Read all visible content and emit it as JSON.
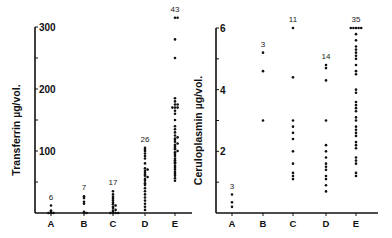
{
  "chart_data": [
    {
      "type": "scatter",
      "title": "",
      "ylabel": "Transferrin  µg/vol.",
      "xlabel": "",
      "ylim": [
        0,
        300
      ],
      "yticks": [
        100,
        200,
        300
      ],
      "ytick_labels": [
        "100",
        "200",
        "300"
      ],
      "categories": [
        "A",
        "B",
        "C",
        "D",
        "E"
      ],
      "counts": [
        "6",
        "7",
        "17",
        "26",
        "43"
      ],
      "series": [
        {
          "name": "A",
          "values": [
            0,
            0,
            0,
            2,
            4,
            12
          ]
        },
        {
          "name": "B",
          "values": [
            0,
            0,
            2,
            15,
            18,
            24,
            27
          ]
        },
        {
          "name": "C",
          "values": [
            0,
            0,
            0,
            0,
            2,
            4,
            5,
            8,
            10,
            12,
            14,
            17,
            20,
            23,
            26,
            30,
            35
          ]
        },
        {
          "name": "D",
          "values": [
            5,
            10,
            15,
            20,
            25,
            30,
            35,
            40,
            45,
            48,
            52,
            55,
            58,
            60,
            62,
            65,
            68,
            70,
            72,
            80,
            88,
            92,
            96,
            100,
            102,
            105
          ]
        },
        {
          "name": "E",
          "values": [
            52,
            56,
            60,
            63,
            66,
            70,
            73,
            76,
            80,
            82,
            85,
            88,
            92,
            95,
            98,
            100,
            103,
            105,
            108,
            110,
            112,
            115,
            118,
            120,
            122,
            125,
            130,
            135,
            140,
            150,
            160,
            165,
            170,
            170,
            170,
            175,
            175,
            180,
            185,
            250,
            280,
            315,
            315
          ]
        }
      ]
    },
    {
      "type": "scatter",
      "title": "",
      "ylabel": "Ceruloplasmin  µg/vol.",
      "xlabel": "",
      "ylim": [
        0,
        6
      ],
      "yticks": [
        2,
        4,
        6
      ],
      "ytick_labels": [
        "2",
        "4",
        "6"
      ],
      "categories": [
        "A",
        "B",
        "C",
        "D",
        "E"
      ],
      "counts": [
        "3",
        "3",
        "11",
        "14",
        "35"
      ],
      "series": [
        {
          "name": "A",
          "values": [
            0.2,
            0.35,
            0.6
          ]
        },
        {
          "name": "B",
          "values": [
            3.0,
            4.6,
            5.2
          ]
        },
        {
          "name": "C",
          "values": [
            1.1,
            1.2,
            1.3,
            1.6,
            2.0,
            2.4,
            2.6,
            2.8,
            3.0,
            4.4,
            6.0
          ]
        },
        {
          "name": "D",
          "values": [
            0.7,
            0.9,
            1.1,
            1.2,
            1.4,
            1.5,
            1.6,
            1.8,
            2.0,
            2.2,
            3.0,
            4.3,
            4.7,
            4.8
          ]
        },
        {
          "name": "E",
          "values": [
            1.2,
            1.3,
            1.6,
            1.7,
            1.8,
            2.1,
            2.2,
            2.3,
            2.5,
            2.6,
            2.7,
            2.8,
            3.0,
            3.1,
            3.3,
            3.4,
            3.5,
            3.6,
            3.9,
            4.0,
            4.5,
            4.6,
            4.8,
            5.0,
            5.1,
            5.2,
            5.3,
            5.4,
            5.6,
            5.8,
            6.0,
            6.0,
            6.0,
            6.0,
            6.0
          ]
        }
      ]
    }
  ]
}
